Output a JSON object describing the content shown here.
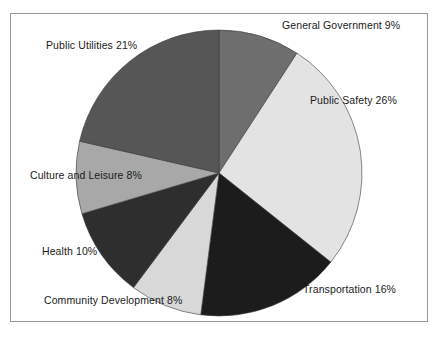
{
  "chart_data": {
    "type": "pie",
    "title": "",
    "subtitle": "",
    "xlabel": "",
    "ylabel": "",
    "legend_position": "none",
    "grid": false,
    "label_format": "{name} {value}%",
    "start_angle_deg": 0,
    "direction": "clockwise",
    "categories": [
      "General Government",
      "Public Safety",
      "Transportation",
      "Community Development",
      "Health",
      "Culture and Leisure",
      "Public Utilities"
    ],
    "values": [
      9,
      26,
      16,
      8,
      10,
      8,
      21
    ],
    "colors": [
      "#6e6e6e",
      "#e3e3e3",
      "#1c1c1c",
      "#d8d8d8",
      "#2e2e2e",
      "#a8a8a8",
      "#565656"
    ],
    "slices": [
      {
        "name": "General Government",
        "value": 9,
        "label": "General Government 9%",
        "color": "#6e6e6e"
      },
      {
        "name": "Public Safety",
        "value": 26,
        "label": "Public Safety 26%",
        "color": "#e3e3e3"
      },
      {
        "name": "Transportation",
        "value": 16,
        "label": "Transportation 16%",
        "color": "#1c1c1c"
      },
      {
        "name": "Community Development",
        "value": 8,
        "label": "Community Development 8%",
        "color": "#d8d8d8"
      },
      {
        "name": "Health",
        "value": 10,
        "label": "Health 10%",
        "color": "#2e2e2e"
      },
      {
        "name": "Culture and Leisure",
        "value": 8,
        "label": "Culture and Leisure 8%",
        "color": "#a8a8a8"
      },
      {
        "name": "Public Utilities",
        "value": 21,
        "label": "Public Utilities 21%",
        "color": "#565656"
      }
    ],
    "total": 98,
    "units": "percent"
  },
  "frame": {
    "border_color": "#9a9a9a",
    "background": "#ffffff"
  }
}
